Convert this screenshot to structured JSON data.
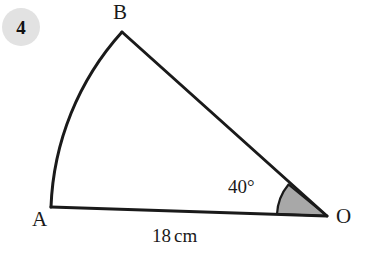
{
  "question": {
    "number": "4"
  },
  "figure": {
    "type": "circular-sector-diagram",
    "labels": {
      "vertex_b": "B",
      "vertex_a": "A",
      "vertex_o": "O",
      "angle": "40°",
      "radius_value": "18",
      "radius_unit": "cm"
    },
    "colors": {
      "stroke": "#1a1a1a",
      "sector_fill": "#a8a8a8",
      "badge_fill": "#e2e2e2",
      "background": "#ffffff"
    },
    "geometry": {
      "center_o": [
        327,
        216
      ],
      "point_a": [
        51,
        207
      ],
      "point_b": [
        122,
        32
      ],
      "radius_px": 276,
      "angle_degrees": 40,
      "angle_marker_radius_px": 50,
      "arc_path": "M 51 207 A 276 276 0 0 1 122 32",
      "line_ob": "M 327 216 L 122 32",
      "line_ao": "M 51 207 L 327 216",
      "angle_marker_path": "M 277 214 A 50 50 0 0 1 288 184 L 327 216 Z"
    }
  }
}
